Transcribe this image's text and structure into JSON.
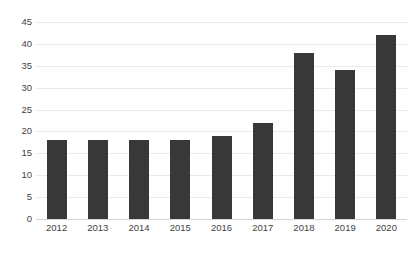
{
  "chart_data": {
    "type": "bar",
    "title": "",
    "subtitle": "",
    "xlabel": "",
    "ylabel": "",
    "categories": [
      "2012",
      "2013",
      "2014",
      "2015",
      "2016",
      "2017",
      "2018",
      "2019",
      "2020"
    ],
    "values": [
      18,
      18,
      18,
      18,
      19,
      22,
      38,
      34,
      42
    ],
    "ylim": [
      0,
      45
    ],
    "ytick_labels": [
      "0",
      "5",
      "10",
      "15",
      "20",
      "25",
      "30",
      "35",
      "40",
      "45"
    ],
    "ytick_values": [
      0,
      5,
      10,
      15,
      20,
      25,
      30,
      35,
      40,
      45
    ],
    "grid": true,
    "grid_axis": "y",
    "legend": false,
    "legend_position": "none",
    "bar_color": "#383838",
    "grid_color": "#e9e9e9",
    "axis_color": "#d5d5d5",
    "tick_label_color": "#3f3f3f",
    "background_color": "#ffffff"
  }
}
